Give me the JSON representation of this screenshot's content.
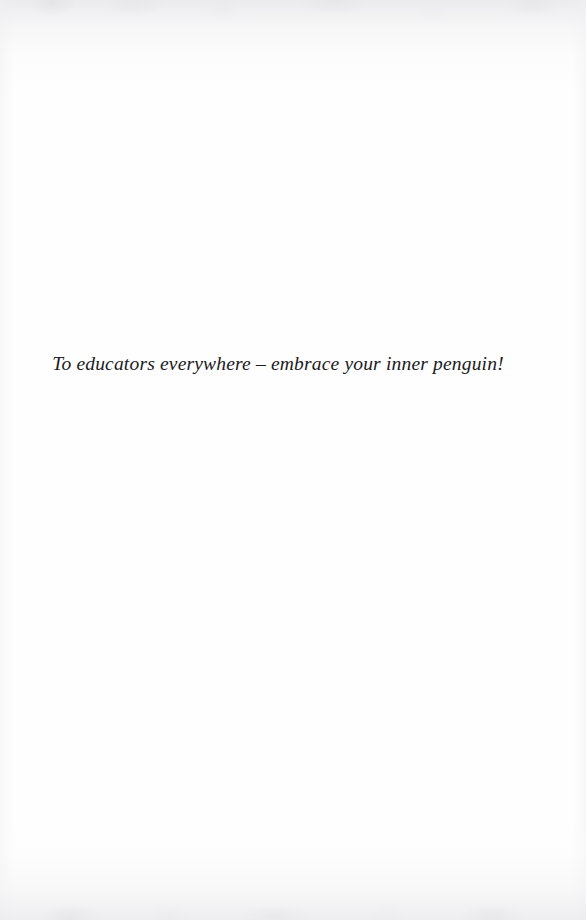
{
  "page": {
    "kind": "book-dedication-page",
    "background_color": "#fefefe",
    "text_color": "#1b1b1d"
  },
  "dedication": {
    "text": "To educators everywhere – embrace your inner penguin!"
  }
}
